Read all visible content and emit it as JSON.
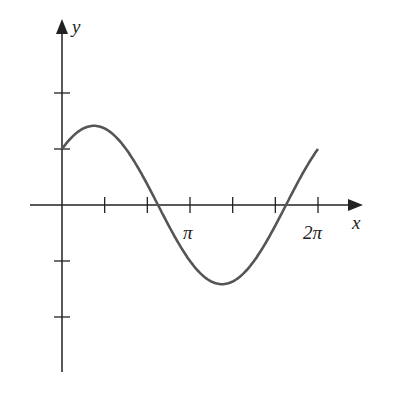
{
  "chart_data": {
    "type": "line",
    "title": "",
    "function": "y = sin x + cos x",
    "xlabel": "x",
    "ylabel": "y",
    "x_tick_labels": [
      {
        "pos": 3.14159,
        "label": "π"
      },
      {
        "pos": 6.28318,
        "label": "2π"
      }
    ],
    "x_ticks": [
      1.047,
      2.094,
      3.1416,
      4.189,
      5.236,
      6.2832
    ],
    "y_ticks": [
      -2,
      -1,
      1,
      2
    ],
    "xlim": [
      -0.6,
      7.0
    ],
    "ylim": [
      -2.9,
      3.0
    ],
    "x": [
      0,
      0.785,
      2.356,
      3.927,
      5.498,
      6.283
    ],
    "values": [
      1,
      1.414,
      0,
      -1.414,
      0,
      1
    ],
    "grid": false,
    "color": "#555555"
  },
  "labels": {
    "x": "x",
    "y": "y",
    "pi": "π",
    "two_pi": "2π"
  }
}
